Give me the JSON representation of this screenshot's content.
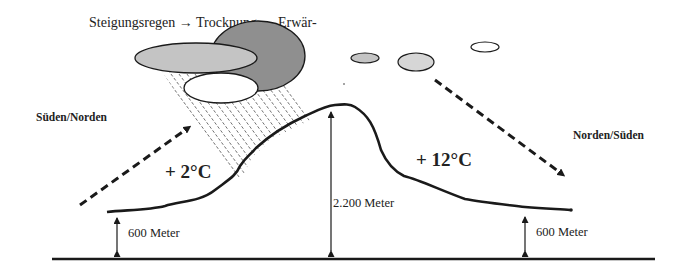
{
  "title": "Steigungsregen → Trocknung → Erwär-",
  "labels": {
    "left_direction": "Süden/Norden",
    "right_direction": "Norden/Süden",
    "windward_temp": "+ 2°C",
    "leeward_temp": "+ 12°C",
    "left_height": "600 Meter",
    "peak_height": "2.200 Meter",
    "right_height": "600 Meter"
  },
  "colors": {
    "line": "#1a1a1a",
    "cloud_dark": "#8f8f8f",
    "cloud_mid": "#c4c4c4",
    "cloud_light": "#d6d6d6",
    "cloud_white": "#ffffff",
    "background": "#ffffff"
  },
  "icons": {
    "wind_arrow_left": "dashed-arrow-up-right",
    "wind_arrow_right": "dashed-arrow-down-right",
    "height_arrow": "double-headed-vertical-arrow",
    "rain": "diagonal-rain-lines",
    "cloud": "ellipse-cloud"
  }
}
